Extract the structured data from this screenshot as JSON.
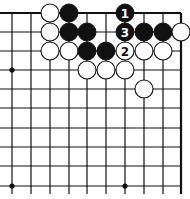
{
  "diagram": {
    "type": "go-board-fragment",
    "corner": "top-right",
    "columns": 10,
    "rows": 10,
    "x_positions": [
      12,
      31,
      50,
      69,
      87,
      106,
      125,
      144,
      163,
      181
    ],
    "y_positions": [
      13,
      32,
      51,
      70,
      89,
      108,
      128,
      147,
      166,
      186
    ],
    "edges": {
      "top": true,
      "right": true,
      "left": false,
      "bottom": false
    },
    "hoshi": [
      {
        "col": 0,
        "row": 3
      },
      {
        "col": 0,
        "row": 9
      },
      {
        "col": 6,
        "row": 9
      }
    ],
    "stone_radius": 9,
    "stones": [
      {
        "col": 2,
        "row": 0,
        "color": "white"
      },
      {
        "col": 3,
        "row": 0,
        "color": "black"
      },
      {
        "col": 6,
        "row": 0,
        "color": "black",
        "label": "1"
      },
      {
        "col": 2,
        "row": 1,
        "color": "white"
      },
      {
        "col": 3,
        "row": 1,
        "color": "black"
      },
      {
        "col": 4,
        "row": 1,
        "color": "black"
      },
      {
        "col": 6,
        "row": 1,
        "color": "black",
        "label": "3"
      },
      {
        "col": 7,
        "row": 1,
        "color": "black"
      },
      {
        "col": 8,
        "row": 1,
        "color": "black"
      },
      {
        "col": 9,
        "row": 1,
        "color": "white"
      },
      {
        "col": 2,
        "row": 2,
        "color": "white"
      },
      {
        "col": 3,
        "row": 2,
        "color": "white"
      },
      {
        "col": 4,
        "row": 2,
        "color": "black"
      },
      {
        "col": 5,
        "row": 2,
        "color": "black"
      },
      {
        "col": 6,
        "row": 2,
        "color": "white",
        "label": "2"
      },
      {
        "col": 7,
        "row": 2,
        "color": "white"
      },
      {
        "col": 8,
        "row": 2,
        "color": "white"
      },
      {
        "col": 4,
        "row": 3,
        "color": "white"
      },
      {
        "col": 5,
        "row": 3,
        "color": "white"
      },
      {
        "col": 6,
        "row": 3,
        "color": "white"
      },
      {
        "col": 7,
        "row": 4,
        "color": "white"
      }
    ],
    "colors": {
      "line": "#111111",
      "black_stone": "#111111",
      "white_stone": "#ffffff",
      "background": "#ffffff"
    }
  }
}
